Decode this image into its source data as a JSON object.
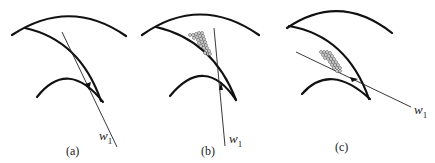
{
  "figure": {
    "panels": [
      {
        "id": "a",
        "label": "(a)",
        "vector_label": "w",
        "vector_subscript": "1",
        "description": "Velocity w1 tangent to blade at leading edge; no particle deposition"
      },
      {
        "id": "b",
        "label": "(b)",
        "vector_label": "w",
        "vector_subscript": "1",
        "description": "Velocity w1 steeper than blade angle; particles accumulate on blade suction side near hub"
      },
      {
        "id": "c",
        "label": "(c)",
        "vector_label": "w",
        "vector_subscript": "1",
        "description": "Velocity w1 shallow angle; particles accumulate on blade pressure side"
      }
    ],
    "colors": {
      "stroke": "#111111",
      "background": "#ffffff"
    }
  }
}
